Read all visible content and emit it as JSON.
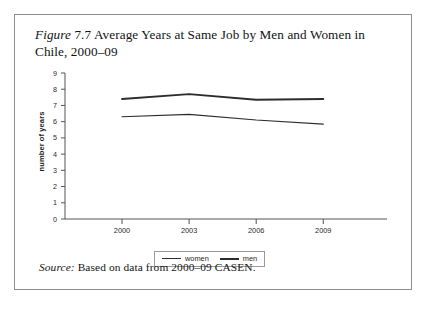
{
  "figure": {
    "label_italic": "Figure",
    "number": "7.7",
    "title_rest": "Average Years at Same Job by Men and Women in Chile, 2000–09",
    "full_title": "Figure 7.7 Average Years at Same Job by Men and Women in Chile, 2000–09"
  },
  "source": {
    "label_italic": "Source:",
    "text": "Based on data from 2000–09 CASEN."
  },
  "legend": {
    "position": "bottom-center",
    "entries": [
      {
        "name": "women",
        "label": "women",
        "style": "thin"
      },
      {
        "name": "men",
        "label": "men",
        "style": "thick"
      }
    ]
  },
  "colors": {
    "line": "#2d2d2d",
    "axis": "#555555",
    "frame": "#8d8d8d",
    "text": "#1a1a1a",
    "background": "#ffffff"
  },
  "chart_data": {
    "type": "line",
    "title": "",
    "xlabel": "",
    "ylabel": "number of years",
    "x": [
      "2000",
      "2003",
      "2006",
      "2009"
    ],
    "categories": [
      "2000",
      "2003",
      "2006",
      "2009"
    ],
    "series": [
      {
        "name": "men",
        "label": "men",
        "values": [
          7.4,
          7.7,
          7.35,
          7.4
        ]
      },
      {
        "name": "women",
        "label": "women",
        "values": [
          6.3,
          6.45,
          6.1,
          5.85
        ]
      }
    ],
    "ylim": [
      0,
      9
    ],
    "xlim": [
      "2000",
      "2009"
    ],
    "ytick_labels": [
      "0",
      "1",
      "2",
      "3",
      "4",
      "5",
      "6",
      "7",
      "8",
      "9"
    ],
    "ytick_values": [
      0,
      1,
      2,
      3,
      4,
      5,
      6,
      7,
      8,
      9
    ],
    "xtick_labels": [
      "2000",
      "2003",
      "2006",
      "2009"
    ],
    "grid": false,
    "legend_position": "below-axis"
  }
}
